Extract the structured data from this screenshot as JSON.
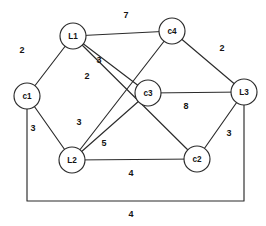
{
  "figure": {
    "background_color": "#ffffff",
    "line_color": "#2b2b2b",
    "text_color": "#141414"
  },
  "graph": {
    "node_radius": 13,
    "nodes": [
      {
        "id": "L1",
        "label": "L1",
        "x": 73,
        "y": 36
      },
      {
        "id": "c4",
        "label": "c4",
        "x": 172,
        "y": 31
      },
      {
        "id": "c1",
        "label": "c1",
        "x": 27,
        "y": 96
      },
      {
        "id": "c3",
        "label": "c3",
        "x": 148,
        "y": 93
      },
      {
        "id": "L3",
        "label": "L3",
        "x": 244,
        "y": 92
      },
      {
        "id": "L2",
        "label": "L2",
        "x": 72,
        "y": 160
      },
      {
        "id": "c2",
        "label": "c2",
        "x": 197,
        "y": 159
      }
    ],
    "edges": [
      {
        "id": "e-l1-c4",
        "from": "L1",
        "to": "c4",
        "weight": "7",
        "label_x": 126,
        "label_y": 15
      },
      {
        "id": "e-l1-c1",
        "from": "L1",
        "to": "c1",
        "weight": "2",
        "label_x": 22,
        "label_y": 50
      },
      {
        "id": "e-l1-c3",
        "from": "L1",
        "to": "c3",
        "weight": "3",
        "label_x": 99,
        "label_y": 60
      },
      {
        "id": "e-l1-c2",
        "from": "L1",
        "to": "c2",
        "weight": "2",
        "label_x": 87,
        "label_y": 76
      },
      {
        "id": "e-c4-l3",
        "from": "c4",
        "to": "L3",
        "weight": "2",
        "label_x": 222,
        "label_y": 48
      },
      {
        "id": "e-c4-l2",
        "from": "c4",
        "to": "L2",
        "weight": "3",
        "label_x": 79,
        "label_y": 122
      },
      {
        "id": "e-c3-l3",
        "from": "c3",
        "to": "L3",
        "weight": "8",
        "label_x": 186,
        "label_y": 106
      },
      {
        "id": "e-c3-l2",
        "from": "c3",
        "to": "L2",
        "weight": "5",
        "label_x": 104,
        "label_y": 143
      },
      {
        "id": "e-c1-l2",
        "from": "c1",
        "to": "L2",
        "weight": "3",
        "label_x": 33,
        "label_y": 128
      },
      {
        "id": "e-l2-c2",
        "from": "L2",
        "to": "c2",
        "weight": "4",
        "label_x": 131,
        "label_y": 173
      },
      {
        "id": "e-c2-l3",
        "from": "c2",
        "to": "L3",
        "weight": "3",
        "label_x": 229,
        "label_y": 133
      },
      {
        "id": "e-c1-l3",
        "from": "c1",
        "to": "L3",
        "weight": "4",
        "label_x": 131,
        "label_y": 214,
        "routed": true,
        "bottom_y": 201
      }
    ]
  }
}
